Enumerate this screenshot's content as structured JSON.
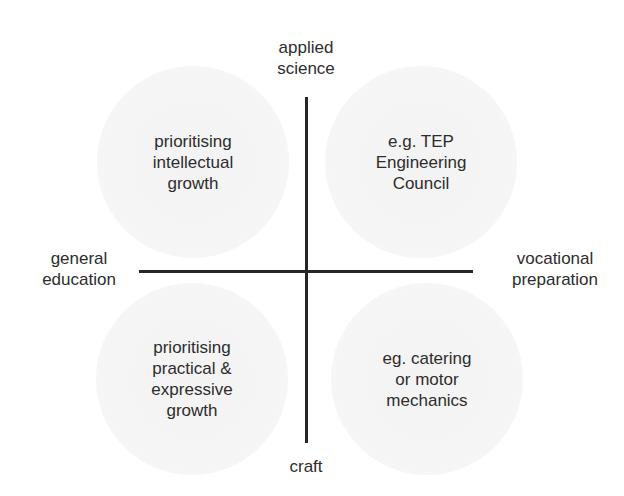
{
  "diagram": {
    "type": "quadrant",
    "axes": {
      "top": "applied\nscience",
      "bottom": "craft",
      "left": "general\neducation",
      "right": "vocational\npreparation"
    },
    "quadrants": {
      "top_left": "prioritising\nintellectual\ngrowth",
      "top_right": "e.g. TEP\nEngineering\nCouncil",
      "bottom_left": "prioritising\npractical &\nexpressive\ngrowth",
      "bottom_right": "eg. catering\nor motor\nmechanics"
    },
    "colors": {
      "axis_line": "#262626",
      "text": "#2d2d2d",
      "circle_fill": "#f4f4f4",
      "background": "#ffffff"
    }
  }
}
